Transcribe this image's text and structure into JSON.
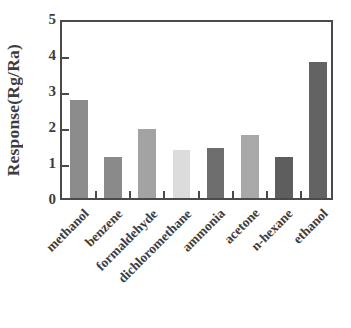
{
  "chart_data": {
    "type": "bar",
    "title": "",
    "subtitle": "",
    "xlabel": "",
    "ylabel": "Response(Rg/Ra)",
    "categories": [
      "methanol",
      "benzene",
      "formaldehyde",
      "dichloromethane",
      "ammonia",
      "acetone",
      "n-hexane",
      "ethanol"
    ],
    "values": [
      2.72,
      1.15,
      1.92,
      1.33,
      1.4,
      1.75,
      1.15,
      3.78
    ],
    "bar_colors": [
      "#8c8c8c",
      "#8a8a8a",
      "#a3a3a3",
      "#dcdcdc",
      "#6e6e6e",
      "#a8a8a8",
      "#5e5e5e",
      "#636363"
    ],
    "ylim": [
      0,
      5
    ],
    "yticks": [
      0,
      1,
      2,
      3,
      4,
      5
    ],
    "ytick_labels": [
      "0",
      "1",
      "2",
      "3",
      "4",
      "5"
    ],
    "xlim": [
      0,
      8
    ],
    "grid": false,
    "legend": null,
    "legend_position": "none",
    "axis_color": "#4a4a4a",
    "text_color": "#3d3d3d",
    "background": "#ffffff"
  }
}
